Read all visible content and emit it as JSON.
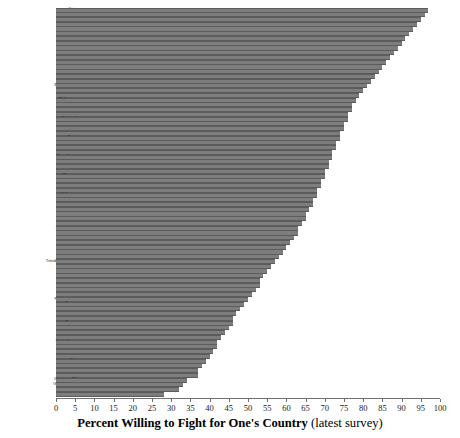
{
  "chart_data": {
    "type": "bar",
    "orientation": "horizontal",
    "title": "Percent Willing to Fight for One's Country (latest survey)",
    "title_bold_part": "Percent Willing to Fight for One's Country",
    "title_light_part": "(latest survey)",
    "xlabel": "Percent Willing to Fight for One's Country (latest survey)",
    "ylabel": "",
    "xlim": [
      0,
      100
    ],
    "xticks": [
      0,
      5,
      10,
      15,
      20,
      25,
      30,
      35,
      40,
      45,
      50,
      55,
      60,
      65,
      70,
      75,
      80,
      85,
      90,
      95,
      100
    ],
    "grid": false,
    "legend": false,
    "bar_color": "#7d7d7d",
    "categories": [
      "Qatar",
      "Bangladesh",
      "Vietnam",
      "Rwanda",
      "Uzbekistan",
      "Tanzania",
      "Jordan",
      "Indonesia",
      "Thailand",
      "Norway",
      "Mali",
      "Singapore",
      "China",
      "Turkey",
      "Taiwan",
      "Croatia",
      "Burkina Faso",
      "Finland",
      "Venezuela",
      "Philippines",
      "Malaysia",
      "Iran",
      "India",
      "Denmark",
      "Macedonia",
      "Israel",
      "Poland",
      "Egypt",
      "Belarus",
      "Iceland",
      "Morocco",
      "Kazakhstan",
      "Ethiopia",
      "Sweden",
      "Armenia",
      "Slovenia",
      "Cyprus",
      "Bosnia",
      "Mexico",
      "Lithuania",
      "Kyrgyzstan",
      "Albania",
      "Russia",
      "Guatemala",
      "Georgia",
      "Ghana",
      "South Korea",
      "Romania",
      "Moldova",
      "Azerbaijan",
      "Peru",
      "Zambia",
      "Switzerland",
      "Trinidad & Tobago",
      "Australia",
      "U.K.",
      "Estonia",
      "South Africa",
      "Serbia",
      "Brazil",
      "U.S.A.",
      "New Zealand",
      "France",
      "Canada",
      "Bulgaria",
      "Argentina",
      "Nigeria",
      "Uruguay",
      "Ukraine",
      "Austria",
      "Luxembourg",
      "Zimbabwe",
      "Hong Kong",
      "Netherlands",
      "Chile",
      "Italy",
      "Andorra",
      "Iraq",
      "Germany (E.)",
      "Germany (W.)",
      "Spain",
      "Japan"
    ],
    "values": [
      97,
      96,
      95,
      94,
      93,
      92,
      91,
      90,
      89,
      88,
      87,
      86,
      85,
      84,
      83,
      82,
      81,
      80,
      79,
      78,
      77,
      77,
      76,
      76,
      75,
      75,
      74,
      74,
      73,
      73,
      72,
      72,
      71,
      71,
      70,
      70,
      69,
      69,
      68,
      68,
      67,
      67,
      66,
      65,
      65,
      64,
      63,
      63,
      62,
      61,
      60,
      59,
      58,
      57,
      56,
      55,
      54,
      53,
      53,
      52,
      51,
      50,
      49,
      48,
      47,
      46,
      46,
      45,
      44,
      43,
      42,
      42,
      41,
      40,
      39,
      38,
      37,
      37,
      34,
      33,
      32,
      28
    ],
    "value_unit": "percent"
  },
  "axis": {
    "tick_labels": [
      "0",
      "5",
      "10",
      "15",
      "20",
      "25",
      "30",
      "35",
      "40",
      "45",
      "50",
      "55",
      "60",
      "65",
      "70",
      "75",
      "80",
      "85",
      "90",
      "95",
      "100"
    ]
  }
}
